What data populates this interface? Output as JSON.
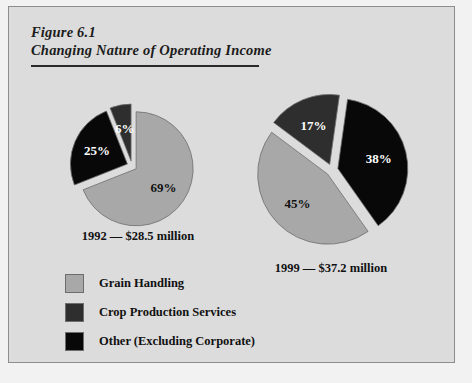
{
  "figure": {
    "number": "Figure 6.1",
    "title": "Changing Nature of Operating Income"
  },
  "colors": {
    "grain_handling": "#a8a8a8",
    "crop_production_services": "#2e2e2e",
    "other_excluding_corporate": "#080808",
    "background": "#dcdcdc",
    "border": "#8d8d8d",
    "separator": "#e8e8e8"
  },
  "legend": {
    "items": [
      {
        "label": "Grain Handling",
        "color": "#a8a8a8"
      },
      {
        "label": "Crop Production Services",
        "color": "#2e2e2e"
      },
      {
        "label": "Other (Excluding Corporate)",
        "color": "#080808"
      }
    ]
  },
  "chart_data": [
    {
      "type": "pie",
      "title": "1992 — $28.5 million",
      "caption": "1992 — $28.5 million",
      "year": "1992",
      "total": "$28.5 million",
      "labels": [
        "Grain Handling",
        "Other (Excluding Corporate)",
        "Crop Production Services"
      ],
      "values": [
        69,
        25,
        6
      ],
      "value_labels": [
        "69%",
        "25%",
        "6%"
      ],
      "colors": [
        "#a8a8a8",
        "#080808",
        "#2e2e2e"
      ],
      "exploded": true,
      "start_angle_deg": 0,
      "legend_position": "bottom-left"
    },
    {
      "type": "pie",
      "title": "1999 — $37.2 million",
      "caption": "1999 — $37.2 million",
      "year": "1999",
      "total": "$37.2 million",
      "labels": [
        "Other (Excluding Corporate)",
        "Grain Handling",
        "Crop Production Services"
      ],
      "values": [
        38,
        45,
        17
      ],
      "value_labels": [
        "38%",
        "45%",
        "17%"
      ],
      "colors": [
        "#080808",
        "#a8a8a8",
        "#2e2e2e"
      ],
      "exploded": true,
      "start_angle_deg": 8,
      "legend_position": "bottom-left"
    }
  ]
}
